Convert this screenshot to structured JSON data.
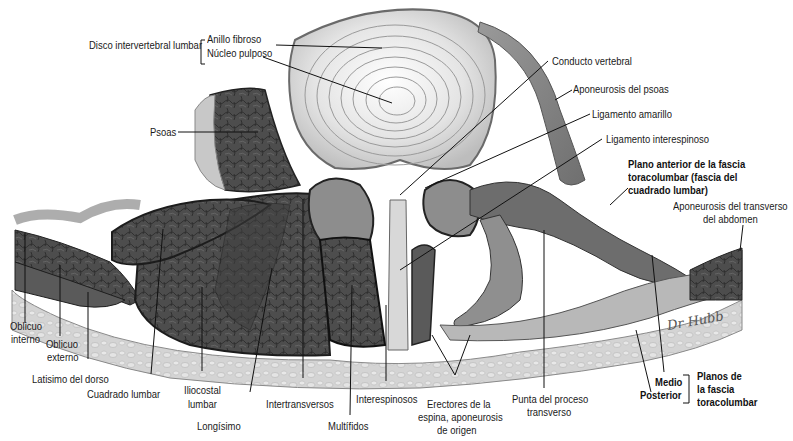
{
  "figure": {
    "signature": "Dr. Hubb"
  },
  "labels": {
    "disco": "Disco intervertebral lumbar",
    "anillo": "Anillo fibroso",
    "nucleo": "Núcleo pulposo",
    "psoas": "Psoas",
    "conducto": "Conducto vertebral",
    "apo_psoas": "Aponeurosis del psoas",
    "lig_amarillo": "Ligamento amarillo",
    "lig_interespinoso": "Ligamento interespinoso",
    "plano_anterior_1": "Plano anterior de la fascia",
    "plano_anterior_2": "toracolumbar (fascia del",
    "plano_anterior_3": "cuadrado lumbar)",
    "apo_transverso_1": "Aponeurosis del transverso",
    "apo_transverso_2": "del abdomen",
    "oblicuo_interno_1": "Oblicuo",
    "oblicuo_interno_2": "interno",
    "oblicuo_externo_1": "Oblicuo",
    "oblicuo_externo_2": "externo",
    "latisimo": "Latisimo del dorso",
    "cuadrado": "Cuadrado lumbar",
    "iliocostal_1": "Iliocostal",
    "iliocostal_2": "lumbar",
    "longisimo": "Longísimo",
    "intertransversos": "Intertransversos",
    "multifidos": "Multífidos",
    "interespinosos": "Interespinosos",
    "erectores_1": "Erectores de la",
    "erectores_2": "espina, aponeurosis",
    "erectores_3": "de origen",
    "punta_1": "Punta del proceso",
    "punta_2": "transverso",
    "medio": "Medio",
    "posterior": "Posterior",
    "planos_1": "Planos de",
    "planos_2": "la fascia",
    "planos_3": "toracolumbar"
  },
  "colors": {
    "muscle": "#4a4a4a",
    "muscle_dark": "#2e2e2e",
    "disc": "#e6e6e6",
    "skin": "#cfcfcf",
    "fascia": "#f2f2f2",
    "leader": "#111111"
  }
}
